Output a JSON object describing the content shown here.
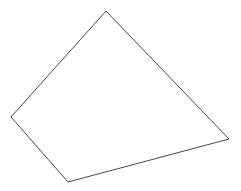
{
  "canvas": {
    "width": 241,
    "height": 191,
    "background_color": "#ffffff"
  },
  "figure": {
    "name": "quadrilateral",
    "shape_type": "polygon",
    "vertex_count": 4,
    "filled": false,
    "fill_color": "none",
    "stroke_color": "#4a4a4a",
    "stroke_width": 1,
    "vertices": [
      {
        "label": "top",
        "x": 106,
        "y": 11
      },
      {
        "label": "right",
        "x": 229,
        "y": 139
      },
      {
        "label": "bottom",
        "x": 68,
        "y": 182
      },
      {
        "label": "left",
        "x": 11,
        "y": 117
      }
    ],
    "points_attr": "106,11 229,139 68,182 11,117",
    "edges": [
      {
        "name": "top-right-edge",
        "from": "top",
        "to": "right"
      },
      {
        "name": "bottom-right-edge",
        "from": "right",
        "to": "bottom"
      },
      {
        "name": "bottom-left-edge",
        "from": "bottom",
        "to": "left"
      },
      {
        "name": "top-left-edge",
        "from": "left",
        "to": "top"
      }
    ]
  }
}
